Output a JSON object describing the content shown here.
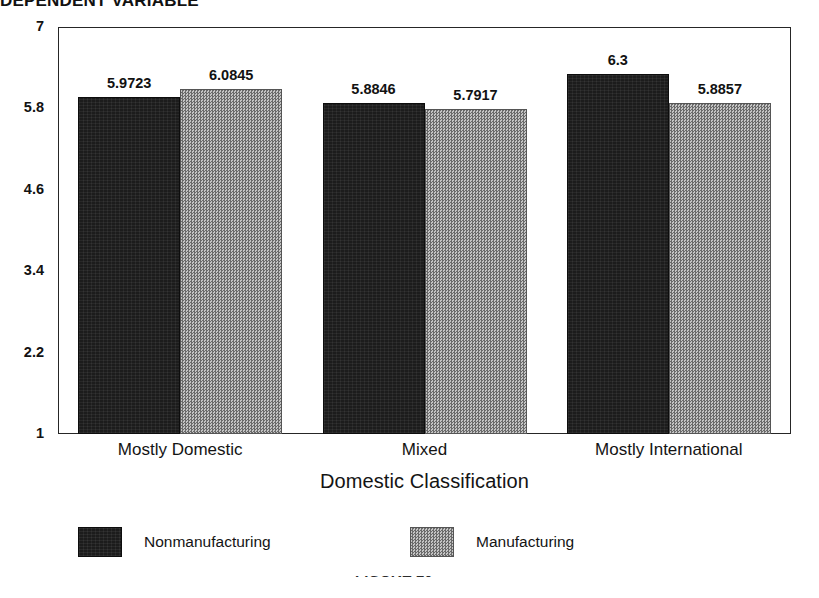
{
  "figure": {
    "top_title_clipped": "DEPENDENT VARIABLE",
    "footer_fragment_clipped": "FIGURE 10"
  },
  "chart_data": {
    "type": "bar",
    "title": "",
    "xlabel": "Domestic Classification",
    "ylabel": "",
    "ylim": [
      1,
      7
    ],
    "yticks": [
      1,
      2.2,
      3.4,
      4.6,
      5.8,
      7
    ],
    "ytick_labels": [
      "1",
      "2.2",
      "3.4",
      "4.6",
      "5.8",
      "7"
    ],
    "grid": false,
    "legend_position": "bottom",
    "categories": [
      "Mostly Domestic",
      "Mixed",
      "Mostly International"
    ],
    "series": [
      {
        "name": "Nonmanufacturing",
        "color": "#1c1c1c",
        "pattern": "solid-dark",
        "values": [
          5.9723,
          5.8846,
          6.3
        ],
        "labels": [
          "5.9723",
          "5.8846",
          "6.3"
        ]
      },
      {
        "name": "Manufacturing",
        "color": "#8e8e8e",
        "pattern": "checkered-gray",
        "values": [
          6.0845,
          5.7917,
          5.8857
        ],
        "labels": [
          "6.0845",
          "5.7917",
          "5.8857"
        ]
      }
    ]
  },
  "axis": {
    "x_title": "Domestic Classification"
  },
  "legend": {
    "items": [
      {
        "label": "Nonmanufacturing",
        "swatch": "dark"
      },
      {
        "label": "Manufacturing",
        "swatch": "light"
      }
    ]
  }
}
